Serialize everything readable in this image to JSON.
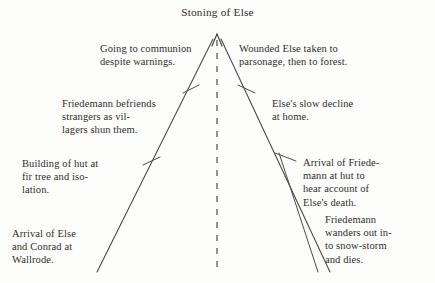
{
  "diagram": {
    "type": "freytag-pyramid",
    "title": "Stoning of Else",
    "apex": {
      "x": 217,
      "y": 36
    },
    "baseline_y": 272,
    "axis": {
      "name": "vertical-dashed-axis",
      "style": "dashed",
      "x": 217,
      "from_y": 38,
      "to_y": 272
    },
    "left_branch": {
      "name": "rising-action-line",
      "from": {
        "x": 97,
        "y": 272
      },
      "to": {
        "x": 213,
        "y": 38
      },
      "ticks": [
        {
          "x": 190,
          "y": 89
        },
        {
          "x": 151,
          "y": 161
        }
      ]
    },
    "right_branch": {
      "name": "falling-action-line",
      "from": {
        "x": 221,
        "y": 38
      },
      "to": {
        "x": 330,
        "y": 272
      },
      "ticks": [
        {
          "x": 246,
          "y": 89
        },
        {
          "x": 288,
          "y": 157
        }
      ],
      "secondary_line": {
        "name": "falling-action-line-secondary",
        "from": {
          "x": 280,
          "y": 155
        },
        "to": {
          "x": 318,
          "y": 272
        }
      }
    },
    "labels": {
      "left": [
        {
          "name": "going-to-communion",
          "text": "Going to communion\ndespite warnings."
        },
        {
          "name": "friedemann-befriends",
          "text": "Friedemann befriends\nstrangers as vil-\nlagers shun them."
        },
        {
          "name": "building-of-hut",
          "text": "Building of hut at\nfir tree and iso-\nlation."
        },
        {
          "name": "arrival-of-else-and-conrad",
          "text": "Arrival of Else\nand Conrad at\nWallrode."
        }
      ],
      "right": [
        {
          "name": "wounded-else-taken",
          "text": "Wounded Else taken to\nparsonage, then to forest."
        },
        {
          "name": "elses-slow-decline",
          "text": "Else's slow decline\nat home."
        },
        {
          "name": "arrival-of-friedemann",
          "text": "Arrival of Friede-\nmann at hut to\nhear account of\nElse's death."
        },
        {
          "name": "friedemann-wanders-out",
          "text": "Friedemann\nwanders out in-\nto snow-storm\nand dies."
        }
      ]
    },
    "colors": {
      "ink": "#2e2e2e",
      "line": "#4a4a4a",
      "background": "#fdfdfb"
    }
  }
}
